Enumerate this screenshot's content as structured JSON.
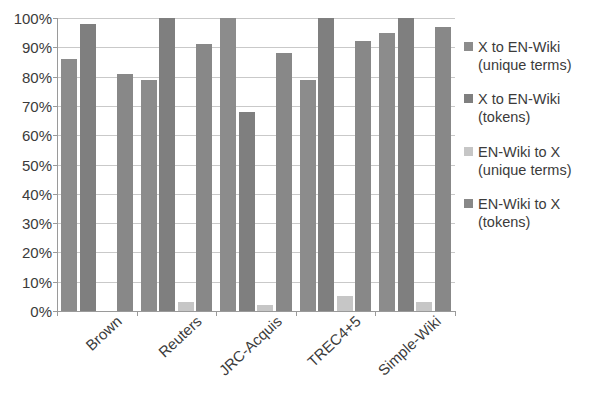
{
  "chart_data": {
    "type": "bar",
    "title": "",
    "subtitle": "",
    "xlabel": "",
    "ylabel": "",
    "categories": [
      "Brown",
      "Reuters",
      "JRC-Acquis",
      "TREC4+5",
      "Simple-Wiki"
    ],
    "series": [
      {
        "name": "X to EN-Wiki (unique terms)",
        "color": "#8c8c8c",
        "values": [
          86,
          79,
          100,
          79,
          95
        ]
      },
      {
        "name": "X to EN-Wiki (tokens)",
        "color": "#7f7f7f",
        "values": [
          98,
          100,
          68,
          100,
          100
        ]
      },
      {
        "name": "EN-Wiki to X (unique terms)",
        "color": "#c6c6c6",
        "values": [
          0,
          3,
          2,
          5,
          3
        ]
      },
      {
        "name": "EN-Wiki to X (tokens)",
        "color": "#888888",
        "values": [
          81,
          91,
          88,
          92,
          97
        ]
      }
    ],
    "ylim": [
      0,
      100
    ],
    "ytick_labels": [
      "100%",
      "90%",
      "80%",
      "70%",
      "60%",
      "50%",
      "40%",
      "30%",
      "20%",
      "10%",
      "0%"
    ],
    "ytick_values": [
      100,
      90,
      80,
      70,
      60,
      50,
      40,
      30,
      20,
      10,
      0
    ],
    "grid": true,
    "legend_position": "right",
    "value_suffix": "%"
  },
  "legend": {
    "items": [
      {
        "line1": "X to EN-Wiki",
        "line2": "(unique terms)",
        "color": "#8c8c8c"
      },
      {
        "line1": "X to EN-Wiki",
        "line2": "(tokens)",
        "color": "#7f7f7f"
      },
      {
        "line1": "EN-Wiki to X",
        "line2": "(unique terms)",
        "color": "#c6c6c6"
      },
      {
        "line1": "EN-Wiki to X",
        "line2": "(tokens)",
        "color": "#888888"
      }
    ]
  }
}
